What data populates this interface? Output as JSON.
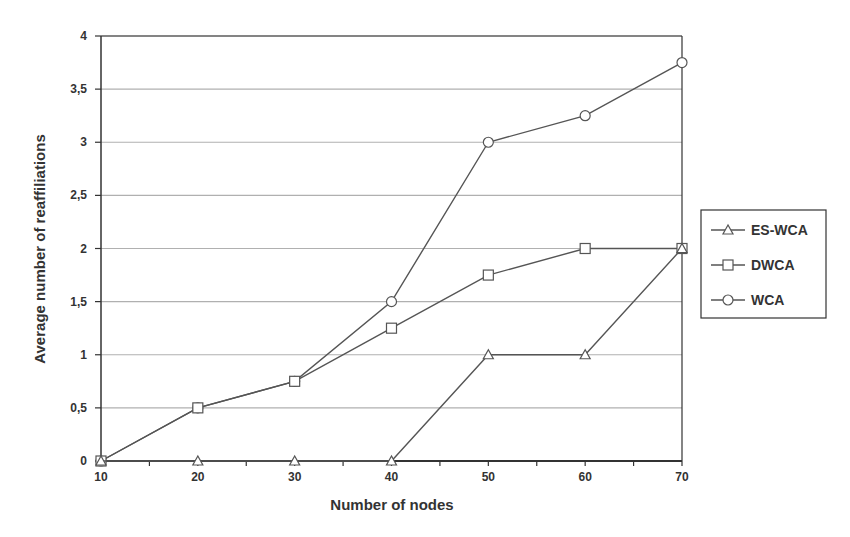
{
  "chart_data": {
    "type": "line",
    "title": "",
    "xlabel": "Number of nodes",
    "ylabel": "Average number of reaffiliations",
    "x": [
      10,
      20,
      30,
      40,
      50,
      60,
      70
    ],
    "xlim": [
      10,
      70
    ],
    "ylim": [
      0,
      4
    ],
    "x_ticks": [
      "10",
      "20",
      "30",
      "40",
      "50",
      "60",
      "70"
    ],
    "y_ticks": [
      "0",
      "0,5",
      "1",
      "1,5",
      "2",
      "2,5",
      "3",
      "3,5",
      "4"
    ],
    "grid": "horizontal",
    "legend_position": "right",
    "series": [
      {
        "name": "ES-WCA",
        "marker": "triangle",
        "values": [
          0,
          0,
          0,
          0,
          1,
          1,
          2
        ]
      },
      {
        "name": "DWCA",
        "marker": "square",
        "values": [
          0,
          0.5,
          0.75,
          1.25,
          1.75,
          2,
          2
        ]
      },
      {
        "name": "WCA",
        "marker": "circle",
        "values": [
          0,
          0.5,
          0.75,
          1.5,
          3,
          3.25,
          3.75
        ]
      }
    ],
    "colors": {
      "line": "#555555",
      "grid": "#b0b0b0",
      "axis": "#333333"
    }
  }
}
